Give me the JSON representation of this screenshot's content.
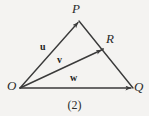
{
  "figure": {
    "caption": "(2)",
    "background_color": "#f4f3f1",
    "stroke_color": "#3a3a3a",
    "points": {
      "P": {
        "label": "P",
        "x": 79,
        "y": 21
      },
      "O": {
        "label": "O",
        "x": 20,
        "y": 88
      },
      "Q": {
        "label": "Q",
        "x": 133,
        "y": 88
      },
      "R": {
        "label": "R",
        "x": 103,
        "y": 49
      }
    },
    "vectors": [
      {
        "name": "u",
        "label": "u",
        "from": "O",
        "to": "P"
      },
      {
        "name": "v",
        "label": "v",
        "from": "O",
        "to": "R"
      },
      {
        "name": "w",
        "label": "w",
        "from": "O",
        "to": "Q"
      }
    ],
    "edges": [
      {
        "name": "edge-OP",
        "from": "O",
        "to": "P"
      },
      {
        "name": "edge-PQ",
        "from": "P",
        "to": "Q"
      },
      {
        "name": "edge-OQ",
        "from": "O",
        "to": "Q"
      }
    ]
  }
}
